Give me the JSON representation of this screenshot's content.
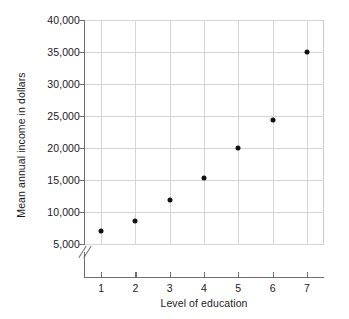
{
  "chart_data": {
    "type": "scatter",
    "title": "",
    "xlabel": "Level of education",
    "ylabel": "Mean annual income in dollars",
    "x": [
      1,
      2,
      3,
      4,
      5,
      6,
      7
    ],
    "values": [
      7000,
      8600,
      11900,
      15300,
      20000,
      24400,
      35000
    ],
    "x_tick_labels": [
      "1",
      "2",
      "3",
      "4",
      "5",
      "6",
      "7"
    ],
    "y_tick_labels": [
      "5,000",
      "10,000",
      "15,000",
      "20,000",
      "25,000",
      "30,000",
      "35,000",
      "40,000"
    ],
    "y_ticks": [
      5000,
      10000,
      15000,
      20000,
      25000,
      30000,
      35000,
      40000
    ],
    "xlim": [
      0.5,
      7.5
    ],
    "ylim": [
      5000,
      40000
    ],
    "grid": true,
    "legend": "none",
    "y_axis_break": true,
    "marker_color": "#111111",
    "grid_color": "#d5d5d5",
    "axis_color": "#6e6e6e"
  }
}
